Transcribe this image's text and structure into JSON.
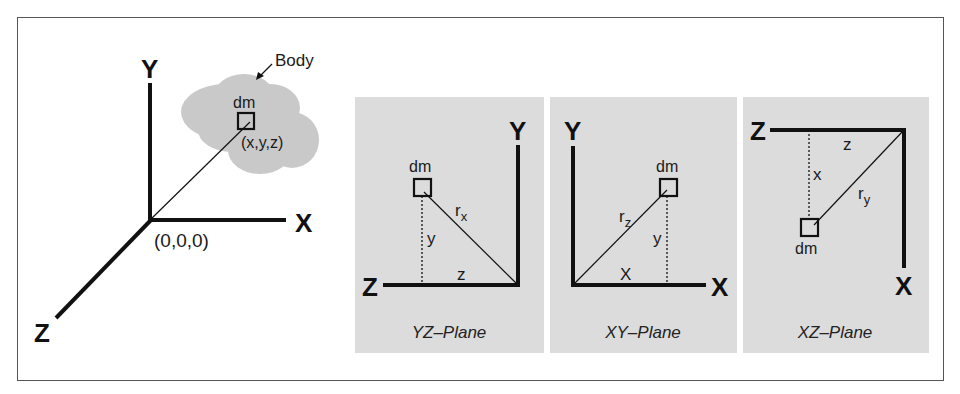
{
  "figure": {
    "main_diagram": {
      "axes": {
        "x": "X",
        "y": "Y",
        "z": "Z"
      },
      "origin_label": "(0,0,0)",
      "body_label": "Body",
      "element_label": "dm",
      "element_coords": "(x,y,z)"
    },
    "panels": [
      {
        "caption": "YZ–Plane",
        "horizontal_axis": "Z",
        "vertical_axis": "Y",
        "element_label": "dm",
        "radius_label": "r",
        "radius_sub": "x",
        "vertical_dist": "y",
        "horizontal_dist": "z"
      },
      {
        "caption": "XY–Plane",
        "horizontal_axis": "X",
        "vertical_axis": "Y",
        "element_label": "dm",
        "radius_label": "r",
        "radius_sub": "z",
        "vertical_dist": "y",
        "horizontal_dist": "X"
      },
      {
        "caption": "XZ–Plane",
        "horizontal_axis": "Z",
        "vertical_axis": "X",
        "element_label": "dm",
        "radius_label": "r",
        "radius_sub": "y",
        "vertical_dist": "x",
        "horizontal_dist": "z"
      }
    ],
    "colors": {
      "panel_bg": "#dcdcdc",
      "body_fill": "#c8c8c8",
      "line": "#111111"
    }
  }
}
